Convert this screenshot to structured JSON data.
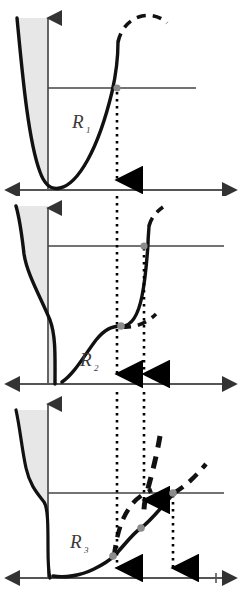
{
  "figure": {
    "type": "diagram",
    "background": "#ffffff",
    "width": 242,
    "height": 594,
    "colors": {
      "curve": "#111111",
      "axis": "#555555",
      "shade": "#e6e6e6",
      "shade_edge": "#111111",
      "marker": "#8c8c8c",
      "dotted": "#000000",
      "label": "#3a3a3a",
      "reference_line": "#444444"
    }
  },
  "panels": [
    {
      "id": "panel-1",
      "label": "R",
      "label_sub": "1",
      "label_x": 72,
      "label_y": 128,
      "y_top": 0,
      "height": 196,
      "axis": {
        "origin_x": 48,
        "baseline_y": 190,
        "y_axis_top": 16,
        "x_axis_left": 6,
        "x_axis_right": 236,
        "x_arrow_both_ends": true,
        "y_arrow": true
      },
      "reference_line": {
        "y": 88,
        "x_start": 48,
        "x_end": 196
      },
      "shaded_region": "left lobe between y-axis and rising left branch",
      "solid_curve": "M 17 18 C 22 70 28 140 40 172 C 45 186 52 190 60 188 C 78 184 98 150 112 92 C 118 66 119 46 119 40",
      "dashed_curve": "M 119 40 C 122 28 130 20 142 17 C 152 15 160 17 166 22",
      "markers": [
        {
          "x": 117,
          "y": 88,
          "label": "intersection-1"
        }
      ],
      "dotted_drops": [
        {
          "x": 117,
          "y_start": 90,
          "y_end": 186,
          "arrow": "down"
        }
      ]
    },
    {
      "id": "panel-2",
      "label": "R",
      "label_sub": "2",
      "label_x": 80,
      "label_y": 366,
      "y_top": 196,
      "height": 196,
      "axis": {
        "origin_x": 48,
        "baseline_y": 384,
        "y_axis_top": 206,
        "x_axis_left": 6,
        "x_axis_right": 236,
        "x_arrow_both_ends": true,
        "y_arrow": true
      },
      "reference_line": {
        "y": 246,
        "x_start": 48,
        "x_end": 224
      },
      "shaded_region": "left lobe with inflection shoulder",
      "solid_curve": "M 16 200 C 20 214 22 228 24 248 C 26 266 40 290 56 318 C 72 344 86 356 104 360 C 120 363 128 352 136 330 C 143 310 146 276 148 258 C 150 248 151 242 152 236",
      "dashed_curve_upper": "M 152 236 C 154 226 158 218 166 212",
      "dashed_curve_lower": "M 104 360 C 120 360 134 356 146 346",
      "markers": [
        {
          "x": 144,
          "y": 246,
          "label": "intersection-upper"
        },
        {
          "x": 104,
          "y": 327,
          "label": "intersection-lower"
        }
      ],
      "dotted_drops": [
        {
          "x": 117,
          "y_start": 196,
          "y_end": 380,
          "arrow": "down"
        },
        {
          "x": 144,
          "y_start": 248,
          "y_end": 380,
          "arrow": "down"
        }
      ]
    },
    {
      "id": "panel-3",
      "label": "R",
      "label_sub": "3",
      "label_x": 70,
      "label_y": 548,
      "y_top": 392,
      "height": 202,
      "axis": {
        "origin_x": 48,
        "baseline_y": 578,
        "y_axis_top": 404,
        "x_axis_left": 6,
        "x_axis_right": 236,
        "x_arrow_both_ends": true,
        "y_arrow": true,
        "tick_x": 216
      },
      "reference_line": {
        "y": 493,
        "x_start": 48,
        "x_end": 224
      },
      "shaded_region": "left lobe with pronounced shoulder near mid height",
      "solid_curve": "M 16 414 C 20 430 22 452 26 470 C 30 486 38 494 44 500 C 48 504 48 520 48 540 C 48 558 50 570 54 575 C 62 579 78 579 92 574 C 110 566 124 548 136 530 C 148 512 162 498 176 492",
      "dashed_branch_a": "M 113 556 C 116 540 120 524 126 512 C 132 500 140 494 150 490",
      "dashed_branch_b": "M 176 492 C 186 486 196 478 204 470",
      "dashed_spike": "M 160 440 C 158 460 152 480 146 500",
      "markers": [
        {
          "x": 113,
          "y": 556,
          "label": "intersection-a"
        },
        {
          "x": 141,
          "y": 528,
          "label": "intersection-b"
        },
        {
          "x": 173,
          "y": 493,
          "label": "intersection-c"
        }
      ],
      "dotted_drops": [
        {
          "x": 117,
          "y_start": 392,
          "y_end": 574,
          "arrow": "down"
        },
        {
          "x": 144,
          "y_start": 392,
          "y_end": 505,
          "arrow": "down"
        },
        {
          "x": 173,
          "y_start": 495,
          "y_end": 574,
          "arrow": "down"
        }
      ]
    }
  ]
}
